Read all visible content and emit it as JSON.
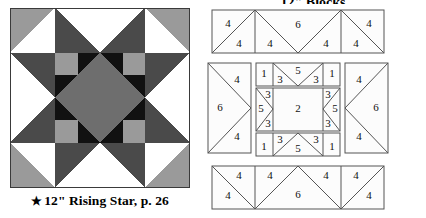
{
  "block": {
    "caption_star": "★",
    "caption_text": "12\" Rising Star, p. 26",
    "colors": {
      "background": "#ffffff",
      "light_gray": "#9a9a9a",
      "mid_gray": "#6e6e6e",
      "dark_gray": "#4a4a4a",
      "black": "#111111",
      "outline": "#000000"
    },
    "name": "Rising Star",
    "size_label": "12\"",
    "page_ref": "p. 26"
  },
  "diagram": {
    "title": "12\" Blocks",
    "stroke": "#404040",
    "fill": "#fcfcfc",
    "units": {
      "top_row": [
        {
          "piece": "4",
          "position": "left-upper"
        },
        {
          "piece": "4",
          "position": "left-lower"
        },
        {
          "piece": "4",
          "position": "center-left-lower"
        },
        {
          "piece": "6",
          "position": "center-upper"
        },
        {
          "piece": "4",
          "position": "center-right-lower"
        },
        {
          "piece": "4",
          "position": "right-lower"
        },
        {
          "piece": "4",
          "position": "right-upper"
        }
      ],
      "left_unit": [
        {
          "piece": "4",
          "position": "upper-right"
        },
        {
          "piece": "6",
          "position": "left"
        },
        {
          "piece": "4",
          "position": "lower-right"
        }
      ],
      "right_unit": [
        {
          "piece": "4",
          "position": "upper-left"
        },
        {
          "piece": "6",
          "position": "right"
        },
        {
          "piece": "4",
          "position": "lower-left"
        }
      ],
      "center_top_strip": [
        {
          "piece": "1",
          "position": "left"
        },
        {
          "piece": "3",
          "position": "inner-left"
        },
        {
          "piece": "5",
          "position": "middle"
        },
        {
          "piece": "3",
          "position": "inner-right"
        },
        {
          "piece": "1",
          "position": "right"
        }
      ],
      "center_middle_strip": [
        {
          "piece": "3",
          "position": "left-upper"
        },
        {
          "piece": "5",
          "position": "left-middle"
        },
        {
          "piece": "3",
          "position": "left-lower"
        },
        {
          "piece": "2",
          "position": "center-square"
        },
        {
          "piece": "3",
          "position": "right-upper"
        },
        {
          "piece": "5",
          "position": "right-middle"
        },
        {
          "piece": "3",
          "position": "right-lower"
        }
      ],
      "center_bottom_strip": [
        {
          "piece": "1",
          "position": "left"
        },
        {
          "piece": "3",
          "position": "inner-left"
        },
        {
          "piece": "5",
          "position": "middle"
        },
        {
          "piece": "3",
          "position": "inner-right"
        },
        {
          "piece": "1",
          "position": "right"
        }
      ],
      "bottom_row": [
        {
          "piece": "4",
          "position": "left-lower"
        },
        {
          "piece": "4",
          "position": "left-upper"
        },
        {
          "piece": "4",
          "position": "center-left-upper"
        },
        {
          "piece": "6",
          "position": "center-lower"
        },
        {
          "piece": "4",
          "position": "center-right-upper"
        },
        {
          "piece": "4",
          "position": "right-upper"
        },
        {
          "piece": "4",
          "position": "right-lower"
        }
      ]
    },
    "labels": {
      "top": [
        "4",
        "4",
        "4",
        "6",
        "4",
        "4",
        "4"
      ],
      "left": [
        "4",
        "6",
        "4"
      ],
      "right": [
        "4",
        "6",
        "4"
      ],
      "center_top": [
        "1",
        "3",
        "5",
        "3",
        "1"
      ],
      "center_mid": [
        "3",
        "5",
        "3",
        "2",
        "3",
        "5",
        "3"
      ],
      "center_bottom": [
        "1",
        "3",
        "5",
        "3",
        "1"
      ],
      "bottom": [
        "4",
        "4",
        "4",
        "6",
        "4",
        "4",
        "4"
      ]
    }
  }
}
